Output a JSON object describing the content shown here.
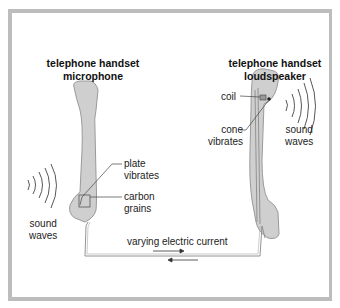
{
  "diagram": {
    "microphone": {
      "title_line1": "telephone handset",
      "title_line2": "microphone",
      "labels": {
        "plate_line1": "plate",
        "plate_line2": "vibrates",
        "carbon_line1": "carbon",
        "carbon_line2": "grains"
      },
      "sound_waves_line1": "sound",
      "sound_waves_line2": "waves"
    },
    "loudspeaker": {
      "title_line1": "telephone handset",
      "title_line2": "loudspeaker",
      "labels": {
        "coil": "coil",
        "cone_line1": "cone",
        "cone_line2": "vibrates"
      },
      "sound_waves_line1": "sound",
      "sound_waves_line2": "waves"
    },
    "circuit_label": "varying electric current",
    "colors": {
      "handset_fill": "#cfcfcf",
      "handset_outline": "#9a9a9a",
      "frame": "#bdbdbd",
      "wire": "#888888",
      "text": "#222222"
    }
  }
}
